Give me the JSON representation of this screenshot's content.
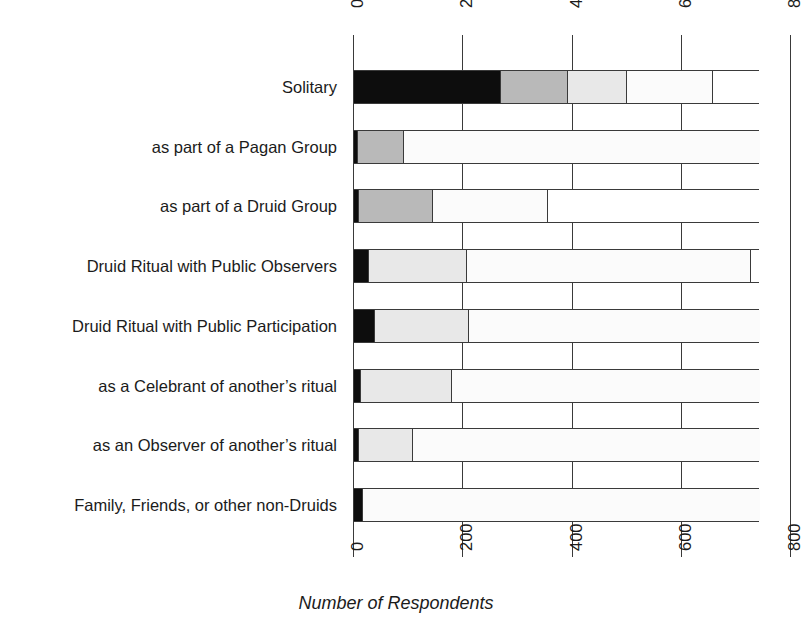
{
  "chart_data": {
    "type": "bar",
    "orientation": "horizontal",
    "stacked": true,
    "title": "",
    "xlabel": "Number of Respondents",
    "ylabel": "",
    "xlim": [
      0,
      800
    ],
    "xticks": [
      0,
      200,
      400,
      600,
      800
    ],
    "xticklabels": [
      "0",
      "200",
      "400",
      "600",
      "800"
    ],
    "grid": true,
    "legend": "none",
    "categories": [
      "Solitary",
      "as part of a Pagan Group",
      "as part of a Druid Group",
      "Druid Ritual with Public Observers",
      "Druid Ritual with Public Participation",
      "as a Celebrant of another's ritual",
      "as an Observer of another's ritual",
      "Family, Friends, or other non-Druids"
    ],
    "series": [
      {
        "name": "segment-1",
        "color": "#0d0d0d",
        "values": [
          269,
          8,
          10,
          27,
          38,
          12,
          10,
          16
        ]
      },
      {
        "name": "segment-2",
        "color": "#b9b9b9",
        "values": [
          123,
          84,
          135,
          0,
          0,
          0,
          0,
          0
        ]
      },
      {
        "name": "segment-3",
        "color": "#e8e8e8",
        "values": [
          108,
          0,
          0,
          180,
          172,
          168,
          98,
          0
        ]
      },
      {
        "name": "segment-4",
        "color": "#fbfbfb",
        "values": [
          157,
          652,
          210,
          519,
          534,
          564,
          636,
          728
        ]
      },
      {
        "name": "segment-5",
        "color": "#ffffff",
        "values": [
          87,
          0,
          389,
          18,
          0,
          0,
          0,
          0
        ]
      }
    ],
    "bar_totals": [
      744,
      744,
      744,
      744,
      744,
      744,
      744,
      744
    ]
  },
  "axis": {
    "title": "Number of Respondents",
    "top_ticks": [
      "0",
      "200",
      "400",
      "600",
      "800"
    ],
    "bottom_ticks": [
      "0",
      "200",
      "400",
      "600",
      "800"
    ]
  },
  "categories": [
    {
      "label": "Solitary"
    },
    {
      "label": "as part of a Pagan Group"
    },
    {
      "label": "as part of a Druid Group"
    },
    {
      "label": "Druid Ritual with Public Observers"
    },
    {
      "label": "Druid Ritual with Public Participation"
    },
    {
      "label": "as a Celebrant of another’s ritual"
    },
    {
      "label": "as an Observer of another’s ritual"
    },
    {
      "label": "Family, Friends, or other non-Druids"
    }
  ],
  "colors": {
    "axis": "#3a3a3a",
    "text": "#1b1b1b",
    "background": "#ffffff",
    "seg1": "#0d0d0d",
    "seg2": "#b9b9b9",
    "seg3": "#e8e8e8",
    "seg4": "#fbfbfb",
    "seg5": "#ffffff"
  }
}
